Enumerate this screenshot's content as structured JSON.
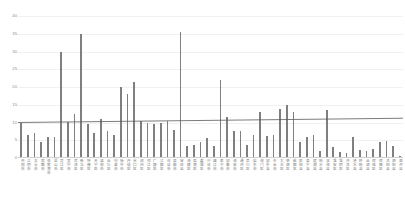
{
  "chart_data": {
    "type": "bar",
    "title": "",
    "xlabel": "",
    "ylabel": "",
    "ylim": [
      0,
      40
    ],
    "grid": true,
    "legend": "none",
    "y_ticks": [
      "0",
      "5",
      "10",
      "15",
      "20",
      "25",
      "30",
      "35",
      "40"
    ],
    "bar_color": "#7f7f7f",
    "trendline_color": "#5a5a5a",
    "gridline_color": "#f0f0f0",
    "axis_color": "#d0d0d0",
    "trendline": {
      "start": 10.0,
      "end": 11.2
    },
    "categories": [
      "丹阳市",
      "江阴市",
      "太仓市",
      "常熟市",
      "张家港市",
      "昆山市",
      "吴江区",
      "宜兴市",
      "武进区",
      "新北区",
      "钟楼区",
      "天宁区",
      "溧阳市",
      "金坛区",
      "句容市",
      "扬中市",
      "丹徒区",
      "京口区",
      "润州区",
      "邗江区",
      "广陵区",
      "江都区",
      "仪征市",
      "高邮市",
      "宝应县",
      "海陵区",
      "高港区",
      "姜堰区",
      "兴化市",
      "靖江市",
      "泰兴市",
      "如皋市",
      "海安市",
      "通州区",
      "崇川区",
      "启东市",
      "海门区",
      "如东县",
      "东台市",
      "大丰区",
      "亭湖区",
      "盐都区",
      "射阳县",
      "阜宁县",
      "建湖县",
      "响水县",
      "滨海县",
      "淮安区",
      "淮阴区",
      "洪泽区",
      "涟水县",
      "盱眙县",
      "金湖县",
      "宿城区",
      "宿豫区",
      "沭阳县",
      "泗阳县",
      "泗洪县"
    ],
    "values": [
      10.0,
      6.5,
      7.0,
      4.5,
      6.0,
      5.8,
      30.0,
      10.2,
      12.5,
      35.0,
      9.5,
      7.0,
      11.0,
      7.5,
      6.5,
      20.0,
      18.0,
      21.5,
      10.5,
      10.0,
      9.5,
      10.0,
      10.5,
      8.0,
      35.5,
      3.5,
      3.8,
      4.5,
      5.5,
      3.5,
      22.0,
      11.5,
      7.5,
      7.5,
      3.8,
      6.5,
      13.0,
      6.2,
      6.5,
      13.8,
      15.0,
      13.0,
      4.5,
      6.0,
      6.5,
      2.0,
      13.5,
      3.0,
      1.8,
      1.5,
      5.8,
      2.2,
      2.0,
      2.5,
      4.5,
      4.8,
      3.5,
      0.5
    ]
  }
}
